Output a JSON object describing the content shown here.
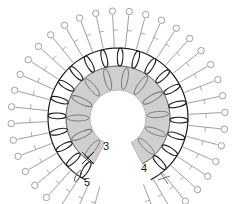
{
  "diagram": {
    "type": "crochet-chart",
    "colors": {
      "inner_band_fill": "#cfcfcf",
      "inner_stitch": "#777777",
      "main_ring": "#1a1a1a",
      "outer_stitch": "#888888"
    },
    "row_labels": [
      {
        "id": "row-3",
        "text": "3"
      },
      {
        "id": "row-4",
        "text": "4"
      },
      {
        "id": "row-5",
        "text": "5"
      }
    ],
    "legend_symbols": [
      "double-crochet-cluster",
      "single-crochet-x",
      "picot"
    ]
  }
}
